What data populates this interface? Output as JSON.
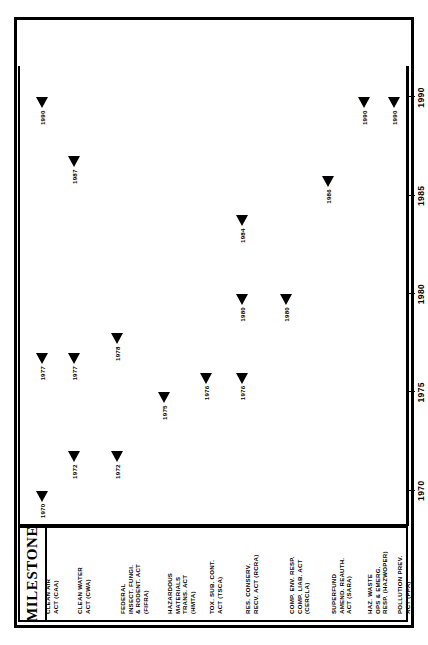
{
  "table": {
    "header": "MILESTONE",
    "rows": [
      {
        "id": "caa",
        "label": "CLEAN AIR\nACT (CAA)"
      },
      {
        "id": "cwa",
        "label": "CLEAN WATER\nACT (CWA)"
      },
      {
        "id": "fifra",
        "label": "FEDERAL\nINSECT. FUNGI.\n& RODENT. ACT\n(FIFRA)"
      },
      {
        "id": "hmta",
        "label": "HAZARDOUS\nMATERIALS\nTRANS. ACT\n(HMTA)"
      },
      {
        "id": "tsca",
        "label": "TOX. SUB. CONT.\nACT (TSCA)"
      },
      {
        "id": "rcra",
        "label": "RES. CONSERV.\nRECV. ACT (RCRA)"
      },
      {
        "id": "cercla",
        "label": "COMP. ENV. RESP.\nCOMP. LIAB. ACT\n(CERCLA)"
      },
      {
        "id": "sara",
        "label": "SUPERFUND\nAMEND. REAUTH.\nACT (SARA)"
      },
      {
        "id": "hazwoper",
        "label": "HAZ. WASTE\nOPS & EMERG.\nRESP. (HAZWOPER)"
      },
      {
        "id": "ppa",
        "label": "POLLUTION PREV.\nACT (PPA)"
      }
    ]
  },
  "chart_data": {
    "type": "scatter",
    "title": "",
    "xlabel": "YEAR",
    "ylabel": "MILESTONE",
    "xlim": [
      1968.2,
      1991.6
    ],
    "xticks": [
      1970,
      1975,
      1980,
      1985,
      1990
    ],
    "xticklabels": [
      "1970",
      "1975",
      "1980",
      "1985",
      "1990"
    ],
    "grid": false,
    "legend": "none",
    "marker": "left-triangle",
    "categories": [
      "CLEAN AIR ACT (CAA)",
      "CLEAN WATER ACT (CWA)",
      "FEDERAL INSECT. FUNGI. & RODENT. ACT (FIFRA)",
      "HAZARDOUS MATERIALS TRANS. ACT (HMTA)",
      "TOX. SUB. CONT. ACT (TSCA)",
      "RES. CONSERV. RECV. ACT (RCRA)",
      "COMP. ENV. RESP. COMP. LIAB. ACT (CERCLA)",
      "SUPERFUND AMEND. REAUTH. ACT (SARA)",
      "HAZ. WASTE OPS & EMERG. RESP. (HAZWOPER)",
      "POLLUTION PREV. ACT (PPA)"
    ],
    "points": [
      {
        "row": 0,
        "year": 1970,
        "label": "1970"
      },
      {
        "row": 0,
        "year": 1977,
        "label": "1977"
      },
      {
        "row": 0,
        "year": 1990,
        "label": "1990"
      },
      {
        "row": 1,
        "year": 1972,
        "label": "1972"
      },
      {
        "row": 1,
        "year": 1977,
        "label": "1977"
      },
      {
        "row": 1,
        "year": 1987,
        "label": "1987"
      },
      {
        "row": 2,
        "year": 1972,
        "label": "1972"
      },
      {
        "row": 2,
        "year": 1978,
        "label": "1978"
      },
      {
        "row": 3,
        "year": 1975,
        "label": "1975"
      },
      {
        "row": 4,
        "year": 1976,
        "label": "1976"
      },
      {
        "row": 5,
        "year": 1976,
        "label": "1976"
      },
      {
        "row": 5,
        "year": 1980,
        "label": "1980"
      },
      {
        "row": 5,
        "year": 1984,
        "label": "1984"
      },
      {
        "row": 6,
        "year": 1980,
        "label": "1980"
      },
      {
        "row": 7,
        "year": 1986,
        "label": "1986"
      },
      {
        "row": 8,
        "year": 1990,
        "label": "1990"
      },
      {
        "row": 9,
        "year": 1990,
        "label": "1990"
      }
    ]
  },
  "colors": {
    "ink": "#000000",
    "paper": "#ffffff"
  }
}
